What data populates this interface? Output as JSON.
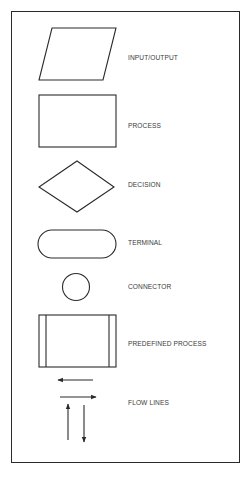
{
  "diagram": {
    "stroke_color": "#2a2a2a",
    "label_color": "#3a3a3a",
    "symbols": [
      {
        "key": "input_output",
        "label": "INPUT/OUTPUT",
        "shape": "parallelogram"
      },
      {
        "key": "process",
        "label": "PROCESS",
        "shape": "rectangle"
      },
      {
        "key": "decision",
        "label": "DECISION",
        "shape": "diamond"
      },
      {
        "key": "terminal",
        "label": "TERMINAL",
        "shape": "rounded-rectangle"
      },
      {
        "key": "connector",
        "label": "CONNECTOR",
        "shape": "circle"
      },
      {
        "key": "predefined_process",
        "label": "PREDEFINED PROCESS",
        "shape": "rectangle-with-side-bars"
      },
      {
        "key": "flow_lines",
        "label": "FLOW LINES",
        "shape": "arrows"
      }
    ]
  }
}
